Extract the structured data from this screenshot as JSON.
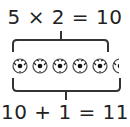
{
  "top_equation": "5 × 2 = 10",
  "bottom_equation": "10 + 1 = 11",
  "balls": {
    "count_full": 5,
    "count_partial": 1,
    "icon": "soccer-ball-icon",
    "color_outline": "#333333",
    "color_patch": "#111111"
  },
  "colors": {
    "text": "#222222",
    "bracket": "#333333",
    "background": "#ffffff"
  }
}
